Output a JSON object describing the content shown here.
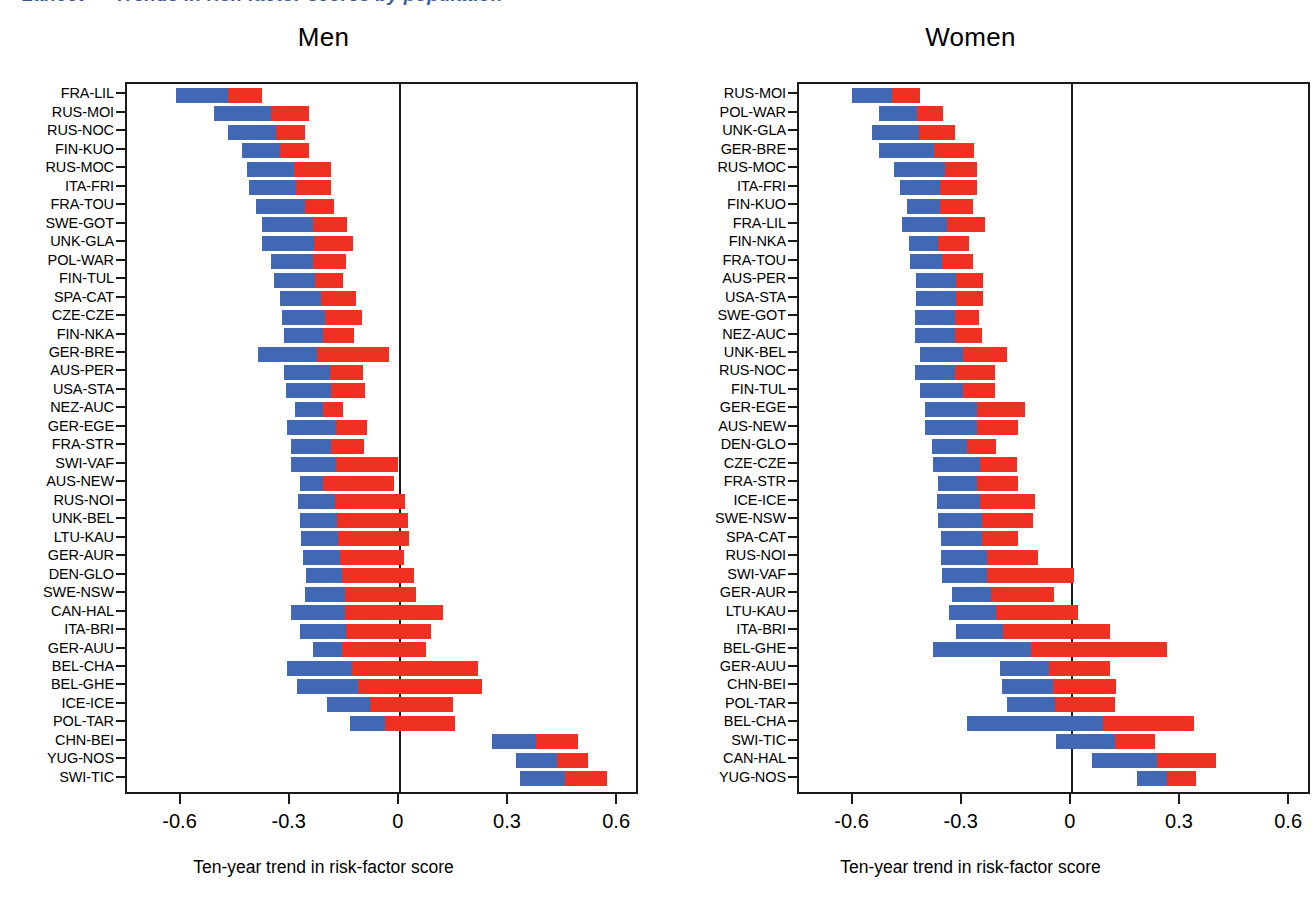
{
  "figure": {
    "clipped_heading": "Lancet — Trends in risk-factor scores by population",
    "axis_title": "Ten-year trend in risk-factor score",
    "colors": {
      "blue": "#4068b4",
      "red": "#ef3124",
      "axis": "#1a1a1a"
    }
  },
  "x_axis": {
    "ticks": [
      "-0.6",
      "-0.3",
      "0",
      "0.3",
      "0.6"
    ],
    "tick_values": [
      -0.6,
      -0.3,
      0,
      0.3,
      0.6
    ],
    "min": -0.75,
    "max": 0.66
  },
  "chart_data": {
    "type": "bar",
    "title": "Ten-year trend in risk-factor score",
    "xlabel": "Ten-year trend in risk-factor score",
    "ylabel": "",
    "xlim": [
      -0.75,
      0.66
    ],
    "grid": false,
    "legend": "none",
    "orientation": "horizontal",
    "stacked": true,
    "note": "Each population has a two-segment horizontal bar: a blue segment then a red segment, plotted end-to-end. Values are segment endpoints read off the axis.",
    "panels": [
      {
        "name": "Men",
        "categories": [
          "FRA-LIL",
          "RUS-MOI",
          "RUS-NOC",
          "FIN-KUO",
          "RUS-MOC",
          "ITA-FRI",
          "FRA-TOU",
          "SWE-GOT",
          "UNK-GLA",
          "POL-WAR",
          "FIN-TUL",
          "SPA-CAT",
          "CZE-CZE",
          "FIN-NKA",
          "GER-BRE",
          "AUS-PER",
          "USA-STA",
          "NEZ-AUC",
          "GER-EGE",
          "FRA-STR",
          "SWI-VAF",
          "AUS-NEW",
          "RUS-NOI",
          "UNK-BEL",
          "LTU-KAU",
          "GER-AUR",
          "DEN-GLO",
          "SWE-NSW",
          "CAN-HAL",
          "ITA-BRI",
          "GER-AUU",
          "BEL-CHA",
          "BEL-GHE",
          "ICE-ICE",
          "POL-TAR",
          "CHN-BEI",
          "YUG-NOS",
          "SWI-TIC"
        ],
        "bars": [
          {
            "label": "FRA-LIL",
            "start": -0.615,
            "mid": -0.472,
            "end": -0.378
          },
          {
            "label": "RUS-MOI",
            "start": -0.51,
            "mid": -0.355,
            "end": -0.25
          },
          {
            "label": "RUS-NOC",
            "start": -0.472,
            "mid": -0.34,
            "end": -0.26
          },
          {
            "label": "FIN-KUO",
            "start": -0.435,
            "mid": -0.33,
            "end": -0.25
          },
          {
            "label": "RUS-MOC",
            "start": -0.42,
            "mid": -0.29,
            "end": -0.19
          },
          {
            "label": "ITA-FRI",
            "start": -0.415,
            "mid": -0.285,
            "end": -0.19
          },
          {
            "label": "FRA-TOU",
            "start": -0.395,
            "mid": -0.262,
            "end": -0.18
          },
          {
            "label": "SWE-GOT",
            "start": -0.38,
            "mid": -0.24,
            "end": -0.145
          },
          {
            "label": "UNK-GLA",
            "start": -0.378,
            "mid": -0.235,
            "end": -0.13
          },
          {
            "label": "POL-WAR",
            "start": -0.355,
            "mid": -0.24,
            "end": -0.148
          },
          {
            "label": "FIN-TUL",
            "start": -0.345,
            "mid": -0.232,
            "end": -0.155
          },
          {
            "label": "SPA-CAT",
            "start": -0.33,
            "mid": -0.218,
            "end": -0.12
          },
          {
            "label": "CZE-CZE",
            "start": -0.325,
            "mid": -0.205,
            "end": -0.105
          },
          {
            "label": "FIN-NKA",
            "start": -0.318,
            "mid": -0.21,
            "end": -0.125
          },
          {
            "label": "GER-BRE",
            "start": -0.39,
            "mid": -0.228,
            "end": -0.03
          },
          {
            "label": "AUS-PER",
            "start": -0.318,
            "mid": -0.192,
            "end": -0.1
          },
          {
            "label": "USA-STA",
            "start": -0.312,
            "mid": -0.188,
            "end": -0.095
          },
          {
            "label": "NEZ-AUC",
            "start": -0.288,
            "mid": -0.212,
            "end": -0.155
          },
          {
            "label": "GER-EGE",
            "start": -0.31,
            "mid": -0.175,
            "end": -0.09
          },
          {
            "label": "FRA-STR",
            "start": -0.298,
            "mid": -0.188,
            "end": -0.098
          },
          {
            "label": "SWI-VAF",
            "start": -0.3,
            "mid": -0.175,
            "end": -0.005
          },
          {
            "label": "AUS-NEW",
            "start": -0.275,
            "mid": -0.21,
            "end": -0.015
          },
          {
            "label": "RUS-NOI",
            "start": -0.28,
            "mid": -0.178,
            "end": 0.015
          },
          {
            "label": "UNK-BEL",
            "start": -0.275,
            "mid": -0.172,
            "end": 0.022
          },
          {
            "label": "LTU-KAU",
            "start": -0.272,
            "mid": -0.17,
            "end": 0.025
          },
          {
            "label": "GER-AUR",
            "start": -0.265,
            "mid": -0.165,
            "end": 0.012
          },
          {
            "label": "DEN-GLO",
            "start": -0.258,
            "mid": -0.158,
            "end": 0.04
          },
          {
            "label": "SWE-NSW",
            "start": -0.262,
            "mid": -0.15,
            "end": 0.045
          },
          {
            "label": "CAN-HAL",
            "start": -0.298,
            "mid": -0.15,
            "end": 0.118
          },
          {
            "label": "ITA-BRI",
            "start": -0.275,
            "mid": -0.148,
            "end": 0.085
          },
          {
            "label": "GER-AUU",
            "start": -0.238,
            "mid": -0.158,
            "end": 0.072
          },
          {
            "label": "BEL-CHA",
            "start": -0.31,
            "mid": -0.132,
            "end": 0.215
          },
          {
            "label": "BEL-GHE",
            "start": -0.282,
            "mid": -0.115,
            "end": 0.225
          },
          {
            "label": "ICE-ICE",
            "start": -0.2,
            "mid": -0.082,
            "end": 0.145
          },
          {
            "label": "POL-TAR",
            "start": -0.138,
            "mid": -0.04,
            "end": 0.152
          },
          {
            "label": "CHN-BEI",
            "start": 0.252,
            "mid": 0.375,
            "end": 0.49
          },
          {
            "label": "YUG-NOS",
            "start": 0.318,
            "mid": 0.432,
            "end": 0.518
          },
          {
            "label": "SWI-TIC",
            "start": 0.33,
            "mid": 0.455,
            "end": 0.57
          }
        ]
      },
      {
        "name": "Women",
        "categories": [
          "RUS-MOI",
          "POL-WAR",
          "UNK-GLA",
          "GER-BRE",
          "RUS-MOC",
          "ITA-FRI",
          "FIN-KUO",
          "FRA-LIL",
          "FIN-NKA",
          "FRA-TOU",
          "AUS-PER",
          "USA-STA",
          "SWE-GOT",
          "NEZ-AUC",
          "UNK-BEL",
          "RUS-NOC",
          "FIN-TUL",
          "GER-EGE",
          "AUS-NEW",
          "DEN-GLO",
          "CZE-CZE",
          "FRA-STR",
          "ICE-ICE",
          "SWE-NSW",
          "SPA-CAT",
          "RUS-NOI",
          "SWI-VAF",
          "GER-AUR",
          "LTU-KAU",
          "ITA-BRI",
          "BEL-GHE",
          "GER-AUU",
          "CHN-BEI",
          "POL-TAR",
          "BEL-CHA",
          "SWI-TIC",
          "CAN-HAL",
          "YUG-NOS"
        ],
        "bars": [
          {
            "label": "RUS-MOI",
            "start": -0.605,
            "mid": -0.495,
            "end": -0.418
          },
          {
            "label": "POL-WAR",
            "start": -0.53,
            "mid": -0.425,
            "end": -0.355
          },
          {
            "label": "UNK-GLA",
            "start": -0.548,
            "mid": -0.42,
            "end": -0.32
          },
          {
            "label": "GER-BRE",
            "start": -0.53,
            "mid": -0.378,
            "end": -0.27
          },
          {
            "label": "RUS-MOC",
            "start": -0.488,
            "mid": -0.348,
            "end": -0.262
          },
          {
            "label": "ITA-FRI",
            "start": -0.472,
            "mid": -0.362,
            "end": -0.262
          },
          {
            "label": "FIN-KUO",
            "start": -0.452,
            "mid": -0.362,
            "end": -0.272
          },
          {
            "label": "FRA-LIL",
            "start": -0.468,
            "mid": -0.342,
            "end": -0.24
          },
          {
            "label": "FIN-NKA",
            "start": -0.448,
            "mid": -0.368,
            "end": -0.282
          },
          {
            "label": "FRA-TOU",
            "start": -0.445,
            "mid": -0.358,
            "end": -0.272
          },
          {
            "label": "AUS-PER",
            "start": -0.428,
            "mid": -0.318,
            "end": -0.245
          },
          {
            "label": "USA-STA",
            "start": -0.428,
            "mid": -0.318,
            "end": -0.245
          },
          {
            "label": "SWE-GOT",
            "start": -0.432,
            "mid": -0.322,
            "end": -0.255
          },
          {
            "label": "NEZ-AUC",
            "start": -0.432,
            "mid": -0.322,
            "end": -0.248
          },
          {
            "label": "UNK-BEL",
            "start": -0.418,
            "mid": -0.298,
            "end": -0.178
          },
          {
            "label": "RUS-NOC",
            "start": -0.43,
            "mid": -0.32,
            "end": -0.212
          },
          {
            "label": "FIN-TUL",
            "start": -0.418,
            "mid": -0.298,
            "end": -0.212
          },
          {
            "label": "GER-EGE",
            "start": -0.405,
            "mid": -0.262,
            "end": -0.128
          },
          {
            "label": "AUS-NEW",
            "start": -0.405,
            "mid": -0.262,
            "end": -0.148
          },
          {
            "label": "DEN-GLO",
            "start": -0.385,
            "mid": -0.288,
            "end": -0.208
          },
          {
            "label": "CZE-CZE",
            "start": -0.382,
            "mid": -0.252,
            "end": -0.152
          },
          {
            "label": "FRA-STR",
            "start": -0.368,
            "mid": -0.262,
            "end": -0.148
          },
          {
            "label": "ICE-ICE",
            "start": -0.372,
            "mid": -0.252,
            "end": -0.102
          },
          {
            "label": "SWE-NSW",
            "start": -0.368,
            "mid": -0.248,
            "end": -0.108
          },
          {
            "label": "SPA-CAT",
            "start": -0.36,
            "mid": -0.248,
            "end": -0.148
          },
          {
            "label": "RUS-NOI",
            "start": -0.36,
            "mid": -0.232,
            "end": -0.092
          },
          {
            "label": "SWI-VAF",
            "start": -0.358,
            "mid": -0.232,
            "end": 0.005
          },
          {
            "label": "GER-AUR",
            "start": -0.33,
            "mid": -0.222,
            "end": -0.048
          },
          {
            "label": "LTU-KAU",
            "start": -0.338,
            "mid": -0.208,
            "end": 0.018
          },
          {
            "label": "ITA-BRI",
            "start": -0.318,
            "mid": -0.188,
            "end": 0.105
          },
          {
            "label": "BEL-GHE",
            "start": -0.382,
            "mid": -0.112,
            "end": 0.262
          },
          {
            "label": "GER-AUU",
            "start": -0.198,
            "mid": -0.062,
            "end": 0.105
          },
          {
            "label": "CHN-BEI",
            "start": -0.192,
            "mid": -0.052,
            "end": 0.12
          },
          {
            "label": "POL-TAR",
            "start": -0.178,
            "mid": -0.045,
            "end": 0.118
          },
          {
            "label": "BEL-CHA",
            "start": -0.288,
            "mid": 0.085,
            "end": 0.335
          },
          {
            "label": "SWI-TIC",
            "start": -0.045,
            "mid": 0.118,
            "end": 0.228
          },
          {
            "label": "CAN-HAL",
            "start": 0.055,
            "mid": 0.235,
            "end": 0.395
          },
          {
            "label": "YUG-NOS",
            "start": 0.178,
            "mid": 0.262,
            "end": 0.34
          }
        ]
      }
    ]
  }
}
